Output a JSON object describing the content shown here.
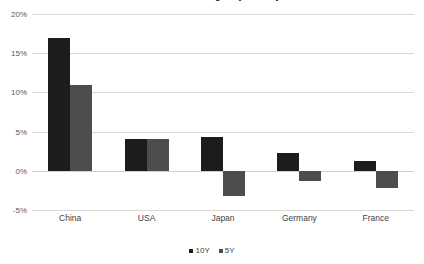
{
  "chart_data": {
    "type": "bar",
    "title": "Bond Yield Changes by Country",
    "subtitle": "",
    "xlabel": "",
    "ylabel": "",
    "categories": [
      "China",
      "USA",
      "Japan",
      "Germany",
      "France"
    ],
    "series": [
      {
        "name": "10Y",
        "color": "#1c1c1c",
        "values": [
          17.0,
          4.0,
          4.3,
          2.3,
          1.2
        ]
      },
      {
        "name": "5Y",
        "color": "#4d4d4d",
        "values": [
          11.0,
          4.0,
          -3.2,
          -1.3,
          -2.2
        ]
      }
    ],
    "ylim": [
      -5,
      20
    ],
    "ytick_values": [
      20,
      15,
      10,
      5,
      0,
      -5
    ],
    "ytick_labels": [
      "20%",
      "15%",
      "10%",
      "5%",
      "0%",
      "-5%"
    ],
    "grid": true,
    "grid_color": "#d9d9d9",
    "legend_position": "bottom",
    "value_format": "percent"
  },
  "legend": {
    "items": [
      {
        "label": "10Y",
        "color": "#1c1c1c"
      },
      {
        "label": "5Y",
        "color": "#4d4d4d"
      }
    ]
  },
  "axis": {
    "y_labels": [
      "20%",
      "15%",
      "10%",
      "5%",
      "0%",
      "-5%"
    ],
    "x_labels": [
      "China",
      "USA",
      "Japan",
      "Germany",
      "France"
    ]
  }
}
